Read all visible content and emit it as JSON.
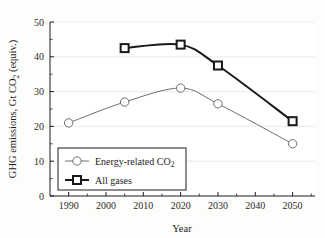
{
  "chart_data": {
    "type": "line",
    "title": "",
    "xlabel": "Year",
    "ylabel": "GHG emissions, Gt CO2 (equiv.)",
    "ylabel_parts": {
      "lead": "GHG emissions, Gt CO",
      "sub": "2",
      "tail": " (equiv.)"
    },
    "xlim": [
      1985,
      2056
    ],
    "ylim": [
      0,
      50
    ],
    "xticks": [
      1990,
      2000,
      2010,
      2020,
      2030,
      2040,
      2050
    ],
    "yticks": [
      0,
      10,
      20,
      30,
      40,
      50
    ],
    "xtick_labels": [
      "1990",
      "2000",
      "2010",
      "2020",
      "2030",
      "2040",
      "2050"
    ],
    "ytick_labels": [
      "0",
      "10",
      "20",
      "30",
      "40",
      "50"
    ],
    "grid": "horizontal",
    "legend_position": "lower-left-inside",
    "series": [
      {
        "name": "Energy-related CO2",
        "name_parts": {
          "lead": "Energy-related CO",
          "sub": "2",
          "tail": ""
        },
        "marker": "circle",
        "color": "#6e6e6e",
        "line_width": 1.0,
        "x": [
          1990,
          2005,
          2020,
          2030,
          2050
        ],
        "values": [
          21.0,
          27.0,
          31.0,
          26.5,
          15.0
        ]
      },
      {
        "name": "All gases",
        "name_parts": {
          "lead": "All gases",
          "sub": "",
          "tail": ""
        },
        "marker": "square",
        "color": "#1a1a1a",
        "line_width": 2.0,
        "x": [
          2005,
          2020,
          2030,
          2050
        ],
        "values": [
          42.5,
          43.5,
          37.5,
          21.5
        ]
      }
    ]
  },
  "legend": {
    "items": [
      {
        "label_lead": "Energy-related CO",
        "label_sub": "2",
        "marker": "circle"
      },
      {
        "label_lead": "All gases",
        "label_sub": "",
        "marker": "square"
      }
    ]
  },
  "colors": {
    "axis": "#1c1c1c",
    "grid": "#e4e4e4",
    "series_1": "#6e6e6e",
    "series_2": "#1a1a1a",
    "background": "#fdfdfb"
  }
}
